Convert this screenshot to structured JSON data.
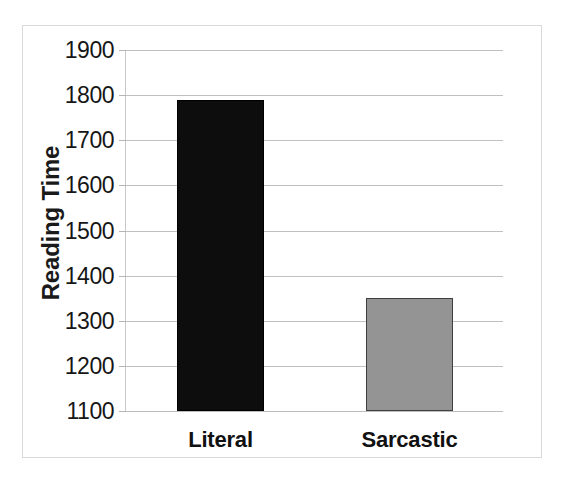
{
  "chart_data": {
    "type": "bar",
    "title": "",
    "subtitle": "",
    "xlabel": "",
    "ylabel": "Reading Time",
    "categories": [
      "Literal",
      "Sarcastic"
    ],
    "values": [
      1790,
      1350
    ],
    "ylim": [
      1100,
      1900
    ],
    "ytick_labels": [
      "1900",
      "1800",
      "1700",
      "1600",
      "1500",
      "1400",
      "1300",
      "1200",
      "1100"
    ],
    "ytick_values": [
      1900,
      1800,
      1700,
      1600,
      1500,
      1400,
      1300,
      1200,
      1100
    ],
    "ytick_step": 100,
    "grid": true,
    "grid_axis": "y",
    "legend": false,
    "legend_position": "none",
    "bar_colors": [
      "#0d0d0d",
      "#949494"
    ],
    "bar_border_colors": [
      "#000000",
      "#3f3f3f"
    ],
    "series": [
      {
        "name": "Reading Time",
        "values": [
          1790,
          1350
        ]
      }
    ],
    "points": [
      {
        "category": "Literal",
        "value": 1790,
        "color": "#0d0d0d"
      },
      {
        "category": "Sarcastic",
        "value": 1350,
        "color": "#949494"
      }
    ]
  },
  "axes": {
    "y_title": "Reading Time",
    "y_ticks": [
      {
        "label": "1900",
        "value": 1900
      },
      {
        "label": "1800",
        "value": 1800
      },
      {
        "label": "1700",
        "value": 1700
      },
      {
        "label": "1600",
        "value": 1600
      },
      {
        "label": "1500",
        "value": 1500
      },
      {
        "label": "1400",
        "value": 1400
      },
      {
        "label": "1300",
        "value": 1300
      },
      {
        "label": "1200",
        "value": 1200
      },
      {
        "label": "1100",
        "value": 1100
      }
    ],
    "x_ticks": [
      {
        "label": "Literal"
      },
      {
        "label": "Sarcastic"
      }
    ]
  },
  "colors": {
    "background": "#ffffff",
    "frame_border": "#d9d9d9",
    "gridline": "#c0c0c0",
    "axis_line": "#c8c8c8",
    "text": "#161616",
    "bar_literal": "#0d0d0d",
    "bar_sarcastic": "#949494"
  }
}
